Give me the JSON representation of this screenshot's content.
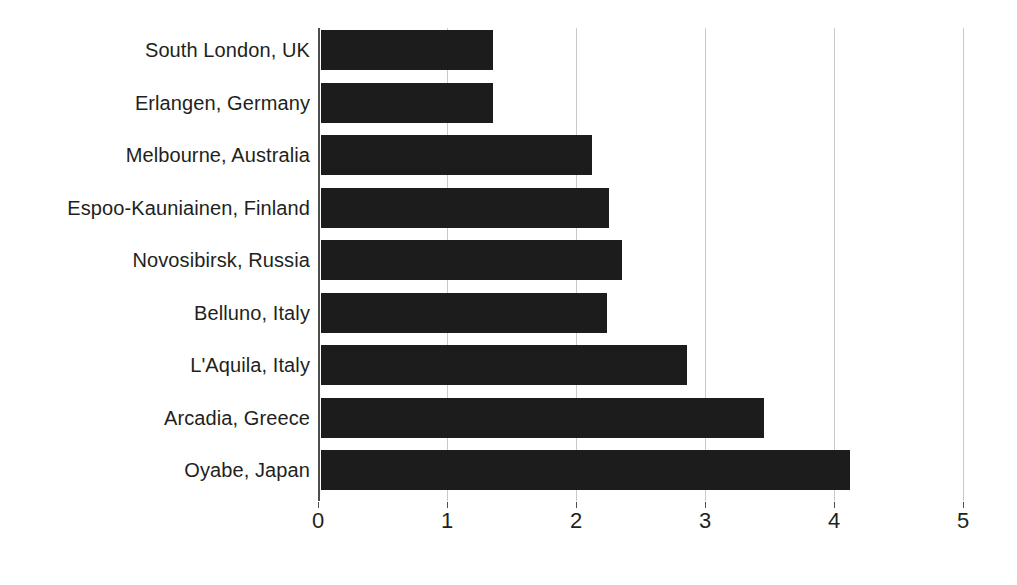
{
  "chart_data": {
    "type": "bar",
    "orientation": "horizontal",
    "title": "",
    "subtitle": "",
    "xlabel": "",
    "ylabel": "",
    "categories": [
      "South London, UK",
      "Erlangen, Germany",
      "Melbourne, Australia",
      "Espoo-Kauniainen, Finland",
      "Novosibirsk, Russia",
      "Belluno, Italy",
      "L'Aquila, Italy",
      "Arcadia, Greece",
      "Oyabe, Japan"
    ],
    "values": [
      1.35,
      1.35,
      2.12,
      2.25,
      2.35,
      2.23,
      2.85,
      3.45,
      4.12
    ],
    "xlim": [
      0,
      5
    ],
    "xticks": [
      0,
      1,
      2,
      3,
      4,
      5
    ],
    "xtick_labels": [
      "0",
      "1",
      "2",
      "3",
      "4",
      "5"
    ],
    "grid": true,
    "grid_axis": "x",
    "legend": false,
    "bar_color": "#1c1c1c",
    "grid_color": "#c9c9c9",
    "axis_color": "#4d4d4d",
    "text_color": "#231f20",
    "background_color": "#ffffff"
  }
}
